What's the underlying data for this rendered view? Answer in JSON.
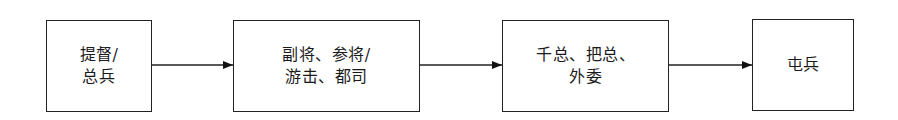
{
  "diagram": {
    "type": "flowchart",
    "direction": "left-to-right",
    "nodes": [
      {
        "id": "n1",
        "label": "提督/\n总兵"
      },
      {
        "id": "n2",
        "label": "副将、参将/\n游击、都司"
      },
      {
        "id": "n3",
        "label": "千总、把总、\n外委"
      },
      {
        "id": "n4",
        "label": "屯兵"
      }
    ],
    "edges": [
      {
        "from": "n1",
        "to": "n2"
      },
      {
        "from": "n2",
        "to": "n3"
      },
      {
        "from": "n3",
        "to": "n4"
      }
    ],
    "colors": {
      "stroke": "#222222",
      "background": "#ffffff",
      "text": "#1a1a1a"
    }
  }
}
